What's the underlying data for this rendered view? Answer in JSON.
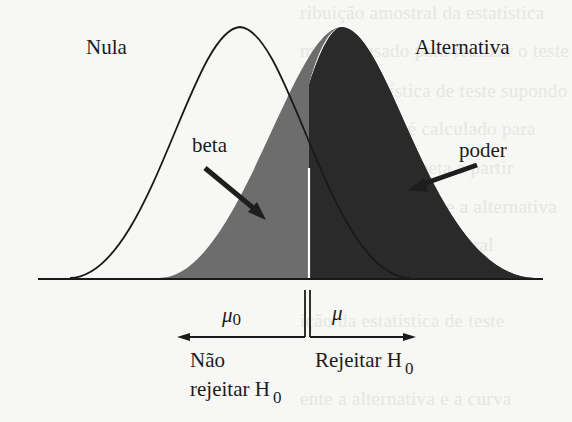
{
  "diagram": {
    "type": "hypothesis-test-power-diagram",
    "curves": {
      "null_label": "Nula",
      "alternative_label": "Alternativa"
    },
    "areas": {
      "beta_label": "beta",
      "power_label": "poder"
    },
    "axis": {
      "mu0_symbol": "μ",
      "mu0_subscript": "0",
      "mu_symbol": "μ"
    },
    "decision": {
      "left_line1": "Não",
      "left_line2": "rejeitar H",
      "left_subscript": "0",
      "right": "Rejeitar H",
      "right_subscript": "0"
    },
    "colors": {
      "beta_fill": "#6d6d6d",
      "power_fill": "#2a2a2a",
      "outline": "#1a1a1a",
      "critical_line": "#ffffff",
      "background": "#f7f7f5"
    }
  },
  "background_text": [
    "ribuição amostral da estatística",
    "modelo usado para realizar o teste",
    "nal da estatística de teste supondo",
    "ente, o poder é calculado para",
    "nativa e o erro beta a partir",
    "entre a curva nula e a alternativa",
    "e a distribuição amostral",
    "ição da estatística de teste",
    "ente a alternativa e a curva"
  ]
}
